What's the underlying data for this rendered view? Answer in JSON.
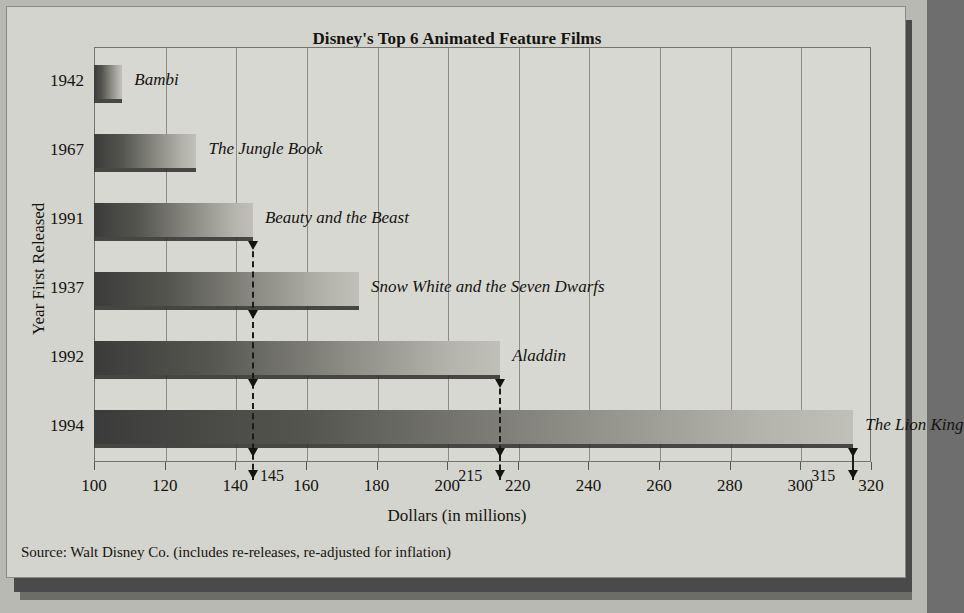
{
  "chart_data": {
    "type": "bar",
    "orientation": "horizontal",
    "title": "Disney's Top 6 Animated Feature Films",
    "xlabel": "Dollars (in millions)",
    "ylabel": "Year First Released",
    "xlim": [
      100,
      320
    ],
    "xticks": [
      100,
      120,
      140,
      160,
      180,
      200,
      220,
      240,
      260,
      280,
      300,
      320
    ],
    "grid": "vertical",
    "legend": "none",
    "categories": [
      "1942",
      "1967",
      "1991",
      "1937",
      "1992",
      "1994"
    ],
    "values": [
      108,
      129,
      145,
      175,
      215,
      315
    ],
    "point_labels": [
      "Bambi",
      "The Jungle Book",
      "Beauty and the Beast",
      "Snow White and the Seven Dwarfs",
      "Aladdin",
      "The Lion King"
    ],
    "annotations": [
      {
        "value": "145",
        "at": 145
      },
      {
        "value": "215",
        "at": 215
      },
      {
        "value": "315",
        "at": 315
      }
    ],
    "source": "Source: Walt Disney Co. (includes re-releases, re-adjusted for inflation)"
  },
  "colors": {
    "background": "#b9b9b4",
    "card": "#d4d4ce",
    "plot": "#d8d8d2",
    "bar_dark": "#3b3b3b",
    "bar_light": "#c0c0b8",
    "grid": "#8d8d86",
    "text": "#15130f"
  }
}
